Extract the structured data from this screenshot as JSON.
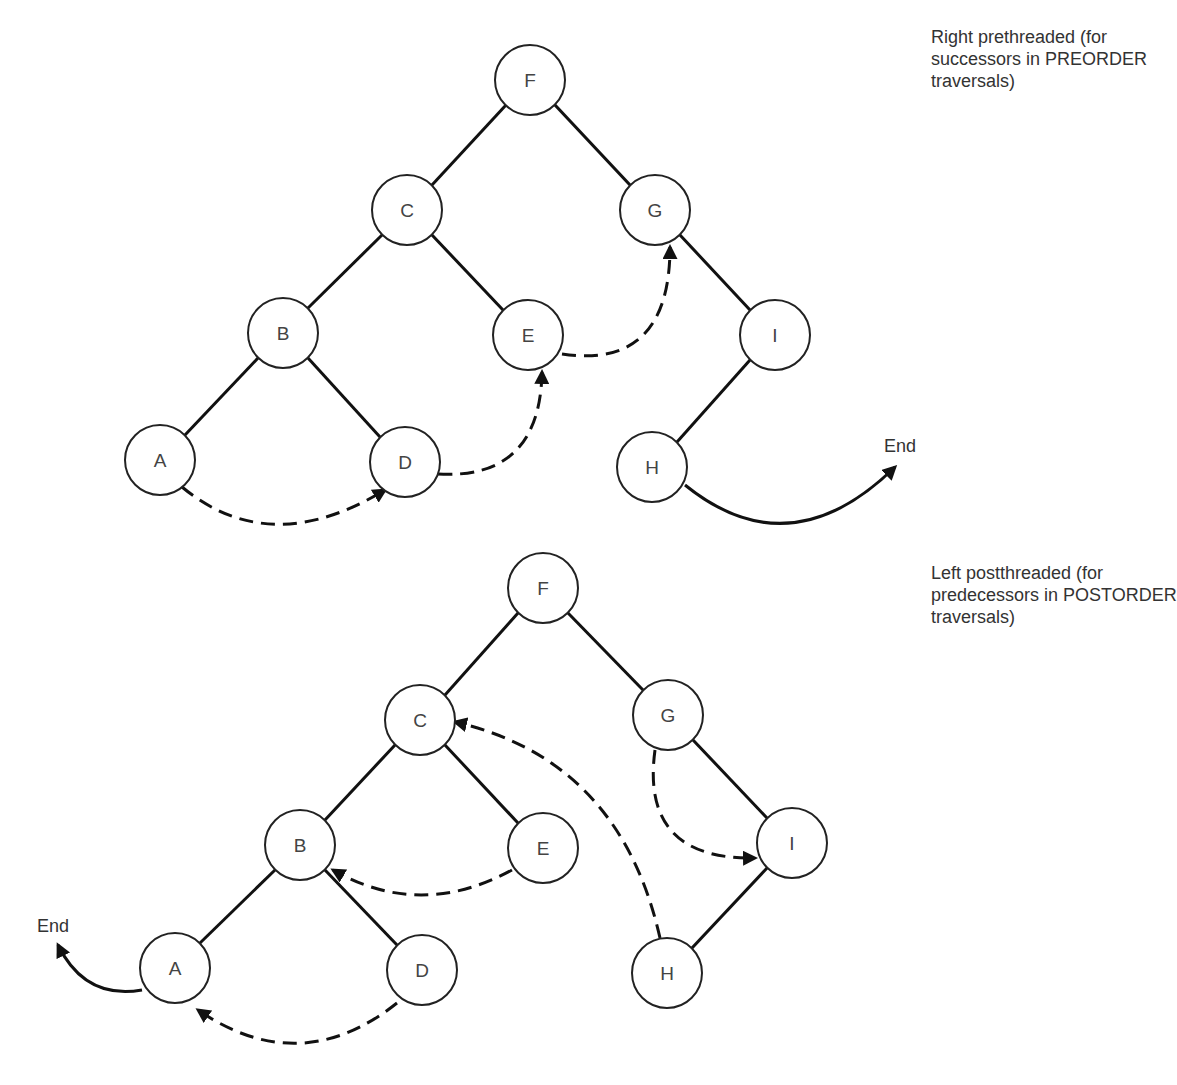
{
  "diagrams": [
    {
      "id": "top",
      "caption": [
        "Right prethreaded (for",
        "successors in PREORDER",
        "traversals)"
      ],
      "end_label": "End",
      "nodes": [
        {
          "label": "F",
          "x": 530,
          "y": 80
        },
        {
          "label": "C",
          "x": 407,
          "y": 210
        },
        {
          "label": "G",
          "x": 655,
          "y": 210
        },
        {
          "label": "B",
          "x": 283,
          "y": 333
        },
        {
          "label": "E",
          "x": 528,
          "y": 335
        },
        {
          "label": "I",
          "x": 775,
          "y": 335
        },
        {
          "label": "A",
          "x": 160,
          "y": 460
        },
        {
          "label": "D",
          "x": 405,
          "y": 462
        },
        {
          "label": "H",
          "x": 652,
          "y": 467
        }
      ],
      "edges": [
        [
          "F",
          "C"
        ],
        [
          "F",
          "G"
        ],
        [
          "C",
          "B"
        ],
        [
          "C",
          "E"
        ],
        [
          "B",
          "A"
        ],
        [
          "B",
          "D"
        ],
        [
          "G",
          "I"
        ],
        [
          "I",
          "H"
        ]
      ],
      "threads": [
        [
          "A",
          "D"
        ],
        [
          "D",
          "E"
        ],
        [
          "E",
          "G"
        ],
        [
          "H",
          "End"
        ]
      ]
    },
    {
      "id": "bottom",
      "caption": [
        "Left postthreaded (for",
        "predecessors in POSTORDER",
        "traversals)"
      ],
      "end_label": "End",
      "nodes": [
        {
          "label": "F",
          "x": 543,
          "y": 588
        },
        {
          "label": "C",
          "x": 420,
          "y": 720
        },
        {
          "label": "G",
          "x": 668,
          "y": 715
        },
        {
          "label": "B",
          "x": 300,
          "y": 845
        },
        {
          "label": "E",
          "x": 543,
          "y": 848
        },
        {
          "label": "I",
          "x": 792,
          "y": 843
        },
        {
          "label": "A",
          "x": 175,
          "y": 968
        },
        {
          "label": "D",
          "x": 422,
          "y": 970
        },
        {
          "label": "H",
          "x": 667,
          "y": 973
        }
      ],
      "edges": [
        [
          "F",
          "C"
        ],
        [
          "F",
          "G"
        ],
        [
          "C",
          "B"
        ],
        [
          "C",
          "E"
        ],
        [
          "B",
          "A"
        ],
        [
          "B",
          "D"
        ],
        [
          "G",
          "I"
        ],
        [
          "I",
          "H"
        ]
      ],
      "threads": [
        [
          "D",
          "A"
        ],
        [
          "E",
          "B"
        ],
        [
          "H",
          "C"
        ],
        [
          "G",
          "I"
        ],
        [
          "A",
          "End"
        ]
      ]
    }
  ]
}
